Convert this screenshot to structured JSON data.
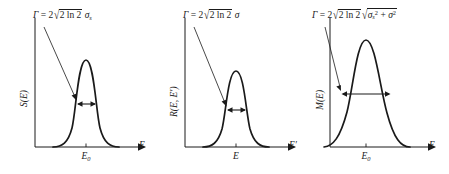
{
  "figure": {
    "background_color": "#ffffff",
    "ink_color": "#1a1a1a",
    "panel_count": 3
  },
  "panels": [
    {
      "id": "panel-source",
      "formula": {
        "lhs": "Γ",
        "equals": "=",
        "coefficient": "2",
        "radicand": "2 ln 2",
        "factor": "σ",
        "factor_subscript": "s",
        "full_text": "Γ = 2√(2 ln 2) σs"
      },
      "y_axis_label": "S(E)",
      "x_axis_label": "E",
      "x_tick_label": "E",
      "x_tick_sub": "0",
      "curve": {
        "shape": "gaussian",
        "relative_width": "narrow",
        "center_frac": 0.5,
        "peak_frac": 0.93
      }
    },
    {
      "id": "panel-resolution",
      "formula": {
        "lhs": "Γ",
        "equals": "=",
        "coefficient": "2",
        "radicand": "2 ln 2",
        "factor": "σ",
        "factor_subscript": "",
        "full_text": "Γ = 2√(2 ln 2) σ"
      },
      "y_axis_label": "R(E, E′)",
      "x_axis_label": "E′",
      "x_tick_label": "E",
      "x_tick_sub": "",
      "curve": {
        "shape": "gaussian",
        "relative_width": "narrow",
        "center_frac": 0.5,
        "peak_frac": 0.86
      }
    },
    {
      "id": "panel-measured",
      "formula": {
        "lhs": "Γ",
        "equals": "=",
        "coefficient": "2",
        "radicand": "2 ln 2",
        "factor": "σ",
        "factor_subscript": "s",
        "inner_radicand_a": "σ",
        "inner_sub_a": "s",
        "inner_sup_a": "2",
        "inner_plus": "+",
        "inner_radicand_b": "σ",
        "inner_sup_b": "2",
        "full_text": "Γ = 2√(2 ln 2) √(σs² + σ²)"
      },
      "y_axis_label": "M(E)",
      "x_axis_label": "E",
      "x_tick_label": "E",
      "x_tick_sub": "0",
      "curve": {
        "shape": "gaussian",
        "relative_width": "wide",
        "center_frac": 0.44,
        "peak_frac": 0.95
      }
    }
  ],
  "annotations": {
    "fwhm_arrow_name": "fwhm-double-arrow",
    "pointer_arrow_name": "formula-pointer-arrow"
  }
}
